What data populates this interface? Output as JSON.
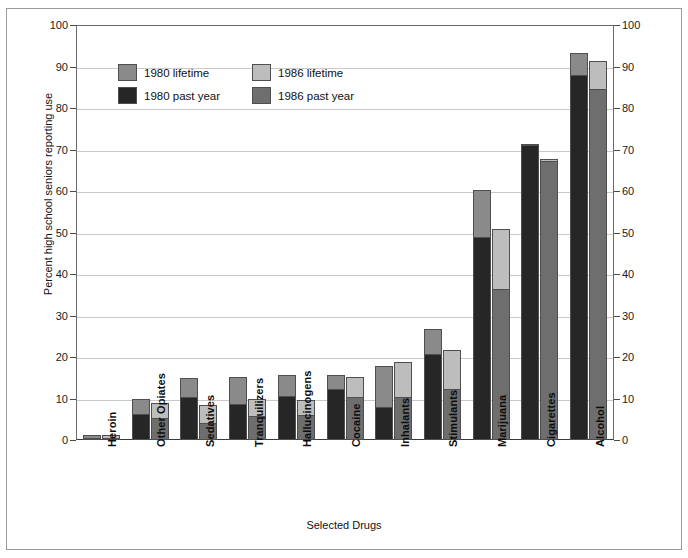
{
  "top_caption": "",
  "chart_data": {
    "type": "bar",
    "title": "",
    "subtitle": "",
    "xlabel": "Selected Drugs",
    "ylabel": "Percent high school seniors reporting use",
    "ylim": [
      0,
      100
    ],
    "ytick_step": 10,
    "yticks": [
      0,
      10,
      20,
      30,
      40,
      50,
      60,
      70,
      80,
      90,
      100
    ],
    "yticks_left": [
      "0",
      "10",
      "20",
      "30",
      "40",
      "50",
      "60",
      "70",
      "80",
      "90",
      "100"
    ],
    "yticks_right": [
      "0",
      "10",
      "20",
      "30",
      "40",
      "50",
      "60",
      "70",
      "80",
      "90",
      "100"
    ],
    "grid": true,
    "grid_axis": "y",
    "legend_position": "upper-left-inside",
    "categories": [
      "Heroin",
      "Other Opiates",
      "Sedatives",
      "Tranquilizers",
      "Hallucinogens",
      "Cocaine",
      "Inhalants",
      "Stimulants",
      "Marijuana",
      "Cigarettes",
      "Alcohol"
    ],
    "series": [
      {
        "name": "1980 lifetime",
        "color": "#8a8a8a",
        "values": [
          1.1,
          9.8,
          14.9,
          15.2,
          15.6,
          15.7,
          17.9,
          26.7,
          60.3,
          71.4,
          93.2
        ]
      },
      {
        "name": "1980 past year",
        "color": "#262626",
        "values": [
          0.5,
          6.2,
          10.3,
          8.7,
          10.6,
          12.3,
          7.9,
          20.8,
          48.8,
          71.0,
          87.9
        ]
      },
      {
        "name": "1986 lifetime",
        "color": "#bdbdbd",
        "values": [
          1.1,
          9.0,
          8.4,
          10.0,
          9.7,
          15.2,
          18.9,
          21.6,
          50.9,
          67.6,
          91.3
        ]
      },
      {
        "name": "1986 past year",
        "color": "#6e6e6e",
        "values": [
          0.5,
          5.2,
          4.2,
          5.8,
          6.1,
          10.3,
          10.4,
          12.3,
          36.5,
          67.2,
          84.5
        ]
      }
    ]
  },
  "legend": {
    "items": [
      {
        "label": "1980 lifetime",
        "color": "#8a8a8a"
      },
      {
        "label": "1986 lifetime",
        "color": "#bdbdbd"
      },
      {
        "label": "1980 past year",
        "color": "#262626"
      },
      {
        "label": "1986 past year",
        "color": "#6e6e6e"
      }
    ]
  }
}
